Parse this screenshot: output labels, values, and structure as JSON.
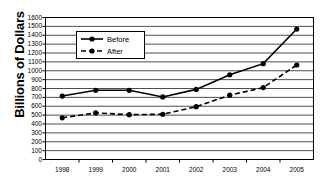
{
  "chart_data": {
    "type": "line",
    "title": "",
    "xlabel": "",
    "ylabel": "Billions of Dollars",
    "categories": [
      "1998",
      "1999",
      "2000",
      "2001",
      "2002",
      "2003",
      "2004",
      "2005"
    ],
    "series": [
      {
        "name": "Before",
        "style": "solid",
        "marker": "filled-circle",
        "color": "#000000",
        "values": [
          715,
          780,
          780,
          705,
          790,
          955,
          1080,
          1470
        ]
      },
      {
        "name": "After",
        "style": "dashed",
        "marker": "filled-circle",
        "color": "#000000",
        "values": [
          470,
          525,
          505,
          510,
          595,
          725,
          810,
          1065
        ]
      }
    ],
    "ylim": [
      0,
      1600
    ],
    "ytick_step": 100,
    "yticks": [
      0,
      100,
      200,
      300,
      400,
      500,
      600,
      700,
      800,
      900,
      1000,
      1100,
      1200,
      1300,
      1400,
      1500,
      1600
    ],
    "grid": "horizontal",
    "legend_position": "upper-left-inside",
    "frame": true
  },
  "axis": {
    "y_title": "Billions of Dollars"
  },
  "legend": {
    "items": [
      {
        "label": "Before"
      },
      {
        "label": "After"
      }
    ]
  }
}
